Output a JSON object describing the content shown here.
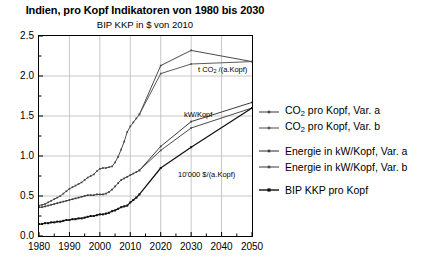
{
  "header": {
    "title": "Indien, pro Kopf Indikatoren von 1980 bis 2030",
    "subtitle": "BIP KKP in $ von 2010"
  },
  "legend": {
    "items": [
      {
        "label_pre": "CO",
        "label_sub": "2",
        "label_post": " pro Kopf, Var. a",
        "color": "#4a4a4a",
        "name": "legend-co2-var-a"
      },
      {
        "label_pre": "CO",
        "label_sub": "2",
        "label_post": " pro Kopf, Var. b",
        "color": "#5a5a5a",
        "name": "legend-co2-var-b"
      },
      {
        "label_pre": "Energie in kW/Kopf, Var. a",
        "label_sub": "",
        "label_post": "",
        "color": "#3c3c3c",
        "name": "legend-energie-var-a"
      },
      {
        "label_pre": "Energie in kW/Kopf, Var. b",
        "label_sub": "",
        "label_post": "",
        "color": "#4a4a4a",
        "name": "legend-energie-var-b"
      },
      {
        "label_pre": "BIP KKP pro Kopf",
        "label_sub": "",
        "label_post": "",
        "color": "#111111",
        "name": "legend-bip-kkp"
      }
    ]
  },
  "annotations": [
    {
      "text_pre": "t CO",
      "text_sub": "2",
      "text_post": " /(a.Kopf)",
      "x": 198,
      "y": 66,
      "name": "annotation-co2"
    },
    {
      "text_pre": "kW/Kopf",
      "text_sub": "",
      "text_post": "",
      "x": 184,
      "y": 111,
      "name": "annotation-kw-kopf"
    },
    {
      "text_pre": "10'000 $/(a.Kopf)",
      "text_sub": "",
      "text_post": "",
      "x": 178,
      "y": 171,
      "name": "annotation-bip"
    }
  ],
  "axes": {
    "y_ticks": [
      "0.0",
      "0.5",
      "1.0",
      "1.5",
      "2.0",
      "2.5"
    ],
    "x_ticks": [
      "1980",
      "1990",
      "2000",
      "2010",
      "2020",
      "2030",
      "2040",
      "2050"
    ]
  },
  "chart_data": {
    "type": "line",
    "title": "Indien, pro Kopf Indikatoren von 1980 bis 2030",
    "subtitle": "BIP KKP in $ von 2010",
    "xlabel": "",
    "ylabel": "",
    "xlim": [
      1980,
      2050
    ],
    "ylim": [
      0.0,
      2.5
    ],
    "grid": true,
    "legend_position": "right",
    "series": [
      {
        "name": "CO2 pro Kopf, Var. a",
        "unit": "t CO2 /(a.Kopf)",
        "color": "#4a4a4a",
        "x": [
          1980,
          1981,
          1982,
          1983,
          1984,
          1985,
          1986,
          1987,
          1988,
          1989,
          1990,
          1991,
          1992,
          1993,
          1994,
          1995,
          1996,
          1997,
          1998,
          1999,
          2000,
          2001,
          2002,
          2003,
          2004,
          2005,
          2006,
          2007,
          2008,
          2009,
          2010,
          2011,
          2012,
          2013,
          2020,
          2030,
          2050
        ],
        "y": [
          0.38,
          0.39,
          0.4,
          0.42,
          0.44,
          0.46,
          0.48,
          0.5,
          0.53,
          0.56,
          0.59,
          0.61,
          0.63,
          0.65,
          0.67,
          0.7,
          0.73,
          0.75,
          0.77,
          0.81,
          0.84,
          0.85,
          0.85,
          0.86,
          0.87,
          0.92,
          0.99,
          1.08,
          1.18,
          1.3,
          1.37,
          1.42,
          1.47,
          1.52,
          2.13,
          2.32,
          2.18
        ]
      },
      {
        "name": "CO2 pro Kopf, Var. b",
        "unit": "t CO2 /(a.Kopf)",
        "color": "#5a5a5a",
        "x": [
          2013,
          2020,
          2030,
          2050
        ],
        "y": [
          1.52,
          2.03,
          2.15,
          2.18
        ]
      },
      {
        "name": "Energie in kW/Kopf, Var. a",
        "unit": "kW/Kopf",
        "color": "#3c3c3c",
        "x": [
          1980,
          1981,
          1982,
          1983,
          1984,
          1985,
          1986,
          1987,
          1988,
          1989,
          1990,
          1991,
          1992,
          1993,
          1994,
          1995,
          1996,
          1997,
          1998,
          1999,
          2000,
          2001,
          2002,
          2003,
          2004,
          2005,
          2006,
          2007,
          2008,
          2009,
          2010,
          2011,
          2012,
          2013,
          2020,
          2030,
          2050
        ],
        "y": [
          0.36,
          0.36,
          0.37,
          0.38,
          0.39,
          0.4,
          0.41,
          0.42,
          0.43,
          0.44,
          0.45,
          0.46,
          0.47,
          0.48,
          0.49,
          0.5,
          0.51,
          0.51,
          0.51,
          0.52,
          0.52,
          0.52,
          0.53,
          0.55,
          0.58,
          0.62,
          0.66,
          0.7,
          0.72,
          0.74,
          0.76,
          0.78,
          0.8,
          0.82,
          1.12,
          1.43,
          1.67
        ]
      },
      {
        "name": "Energie in kW/Kopf, Var. b",
        "unit": "kW/Kopf",
        "color": "#4a4a4a",
        "x": [
          2013,
          2020,
          2030,
          2050
        ],
        "y": [
          0.82,
          1.07,
          1.35,
          1.6
        ]
      },
      {
        "name": "BIP KKP pro Kopf",
        "unit": "10'000 $/(a.Kopf)",
        "color": "#111111",
        "x": [
          1980,
          1981,
          1982,
          1983,
          1984,
          1985,
          1986,
          1987,
          1988,
          1989,
          1990,
          1991,
          1992,
          1993,
          1994,
          1995,
          1996,
          1997,
          1998,
          1999,
          2000,
          2001,
          2002,
          2003,
          2004,
          2005,
          2006,
          2007,
          2008,
          2009,
          2010,
          2011,
          2012,
          2013,
          2020,
          2030,
          2050
        ],
        "y": [
          0.15,
          0.15,
          0.16,
          0.16,
          0.17,
          0.17,
          0.18,
          0.18,
          0.19,
          0.2,
          0.2,
          0.21,
          0.21,
          0.22,
          0.22,
          0.23,
          0.24,
          0.25,
          0.25,
          0.26,
          0.27,
          0.27,
          0.28,
          0.29,
          0.31,
          0.32,
          0.34,
          0.36,
          0.37,
          0.38,
          0.42,
          0.45,
          0.48,
          0.52,
          0.85,
          1.11,
          1.6
        ]
      }
    ]
  }
}
